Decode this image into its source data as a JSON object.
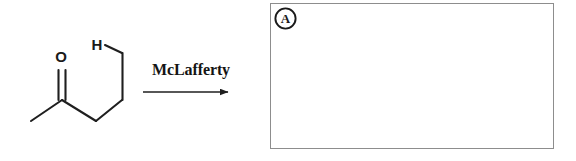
{
  "diagram": {
    "reagent_label": "McLafferty",
    "arrow": {
      "name": "reaction-arrow",
      "direction": "right",
      "x1": 143,
      "y1": 92,
      "x2": 233,
      "y2": 92
    },
    "reactant": {
      "name": "pentan-2-one",
      "atom_labels": [
        {
          "id": "oxygen",
          "text": "O",
          "x": 61,
          "y": 62
        },
        {
          "id": "gamma-hydrogen",
          "text": "H",
          "x": 97,
          "y": 50
        }
      ],
      "bonds": [
        {
          "id": "methyl-to-carbonyl",
          "type": "single",
          "x1": 31,
          "y1": 121,
          "x2": 62,
          "y2": 100
        },
        {
          "id": "carbonyl-double-a",
          "type": "double-a",
          "x1": 58,
          "y1": 100,
          "x2": 58,
          "y2": 70
        },
        {
          "id": "carbonyl-double-b",
          "type": "double-b",
          "x1": 65,
          "y1": 100,
          "x2": 65,
          "y2": 70
        },
        {
          "id": "carbonyl-to-alpha",
          "type": "single",
          "x1": 62,
          "y1": 100,
          "x2": 96,
          "y2": 121
        },
        {
          "id": "alpha-to-beta",
          "type": "single",
          "x1": 96,
          "y1": 121,
          "x2": 122,
          "y2": 100
        },
        {
          "id": "beta-to-gamma",
          "type": "single",
          "x1": 122,
          "y1": 100,
          "x2": 122,
          "y2": 53
        },
        {
          "id": "gamma-to-hydrogen",
          "type": "single",
          "x1": 122,
          "y1": 53,
          "x2": 105,
          "y2": 45
        }
      ]
    },
    "answer_box": {
      "name": "answer-area",
      "marker_letter": "A",
      "content": ""
    }
  },
  "colors": {
    "ink": "#1a1a1a",
    "bond": "#1f1f1f",
    "box_border": "#8d8d8d",
    "background": "#ffffff"
  }
}
